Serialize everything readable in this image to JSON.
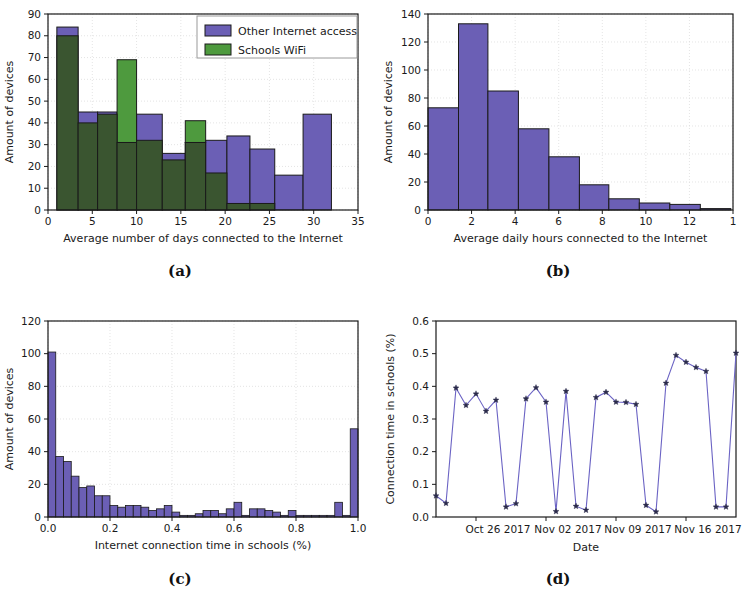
{
  "figure": {
    "caption_a": "(a)",
    "caption_b": "(b)",
    "caption_c": "(c)",
    "caption_d": "(d)"
  },
  "colors": {
    "purple": "#6b5fb5",
    "green": "#4e9a3e",
    "overlap": "#3a5530",
    "edge": "#1a1a1a",
    "line": "#6b63c4",
    "marker": "#2b2b4b",
    "axis": "#1a1a1a",
    "grid": "#d9d9d9",
    "background": "#ffffff"
  },
  "chart_data": [
    {
      "id": "panel_a",
      "type": "bar",
      "title": "",
      "xlabel": "Average number of days connected to the Internet",
      "ylabel": "Amount of devices",
      "xlim": [
        0,
        35
      ],
      "ylim": [
        0,
        90
      ],
      "xticks": [
        0,
        5,
        10,
        15,
        20,
        25,
        30,
        35
      ],
      "yticks": [
        0,
        10,
        20,
        30,
        40,
        50,
        60,
        70,
        80,
        90
      ],
      "grid": true,
      "legend_position": "upper right",
      "bin_width": 3.2,
      "bin_edges": [
        1.0,
        3.4,
        5.6,
        7.8,
        10.0,
        12.2,
        14.4,
        16.6,
        18.8,
        21.0,
        23.2,
        25.4,
        28.6,
        32.0
      ],
      "series": [
        {
          "name": "Other Internet access",
          "color": "#6b5fb5",
          "bins": [
            {
              "x0": 1.0,
              "x1": 3.4,
              "value": 84
            },
            {
              "x0": 3.4,
              "x1": 5.6,
              "value": 45
            },
            {
              "x0": 5.6,
              "x1": 7.8,
              "value": 45
            },
            {
              "x0": 7.8,
              "x1": 10.0,
              "value": 31
            },
            {
              "x0": 10.0,
              "x1": 12.9,
              "value": 44
            },
            {
              "x0": 12.9,
              "x1": 15.5,
              "value": 26
            },
            {
              "x0": 15.5,
              "x1": 17.8,
              "value": 31
            },
            {
              "x0": 17.8,
              "x1": 20.2,
              "value": 32
            },
            {
              "x0": 20.2,
              "x1": 22.8,
              "value": 34
            },
            {
              "x0": 22.8,
              "x1": 25.6,
              "value": 28
            },
            {
              "x0": 25.6,
              "x1": 28.8,
              "value": 16
            },
            {
              "x0": 28.8,
              "x1": 32.0,
              "value": 44
            }
          ]
        },
        {
          "name": "Schools WiFi",
          "color": "#4e9a3e",
          "bins": [
            {
              "x0": 1.0,
              "x1": 3.4,
              "value": 80
            },
            {
              "x0": 3.4,
              "x1": 5.6,
              "value": 40
            },
            {
              "x0": 5.6,
              "x1": 7.8,
              "value": 44
            },
            {
              "x0": 7.8,
              "x1": 10.0,
              "value": 69
            },
            {
              "x0": 10.0,
              "x1": 12.9,
              "value": 32
            },
            {
              "x0": 12.9,
              "x1": 15.5,
              "value": 23
            },
            {
              "x0": 15.5,
              "x1": 17.8,
              "value": 41
            },
            {
              "x0": 17.8,
              "x1": 20.2,
              "value": 17
            },
            {
              "x0": 20.2,
              "x1": 22.8,
              "value": 3
            },
            {
              "x0": 22.8,
              "x1": 25.6,
              "value": 3
            },
            {
              "x0": 25.6,
              "x1": 28.8,
              "value": 0
            },
            {
              "x0": 28.8,
              "x1": 32.0,
              "value": 0
            }
          ]
        }
      ]
    },
    {
      "id": "panel_b",
      "type": "bar",
      "title": "",
      "xlabel": "Average daily hours connected to the Internet",
      "ylabel": "Amount of devices",
      "xlim": [
        0,
        14
      ],
      "ylim": [
        0,
        140
      ],
      "xticks": [
        0,
        2,
        4,
        6,
        8,
        10,
        12,
        14
      ],
      "xtick_labels": [
        "0",
        "2",
        "4",
        "6",
        "8",
        "10",
        "12",
        "1"
      ],
      "yticks": [
        0,
        20,
        40,
        60,
        80,
        100,
        120,
        140
      ],
      "grid": true,
      "color": "#6b5fb5",
      "bins": [
        {
          "x0": 0.0,
          "x1": 1.4,
          "value": 73
        },
        {
          "x0": 1.4,
          "x1": 2.75,
          "value": 133
        },
        {
          "x0": 2.75,
          "x1": 4.15,
          "value": 85
        },
        {
          "x0": 4.15,
          "x1": 5.55,
          "value": 58
        },
        {
          "x0": 5.55,
          "x1": 6.95,
          "value": 38
        },
        {
          "x0": 6.95,
          "x1": 8.3,
          "value": 18
        },
        {
          "x0": 8.3,
          "x1": 9.7,
          "value": 8
        },
        {
          "x0": 9.7,
          "x1": 11.1,
          "value": 5
        },
        {
          "x0": 11.1,
          "x1": 12.5,
          "value": 4
        },
        {
          "x0": 12.5,
          "x1": 13.9,
          "value": 1
        }
      ]
    },
    {
      "id": "panel_c",
      "type": "bar",
      "title": "",
      "xlabel": "Internet connection time in schools (%)",
      "ylabel": "Amount of devices",
      "xlim": [
        0.0,
        1.0
      ],
      "ylim": [
        0,
        120
      ],
      "xticks": [
        0.0,
        0.2,
        0.4,
        0.6,
        0.8,
        1.0
      ],
      "xtick_labels": [
        "0.0",
        "0.2",
        "0.4",
        "0.6",
        "0.8",
        "1.0"
      ],
      "yticks": [
        0,
        20,
        40,
        60,
        80,
        100,
        120
      ],
      "grid": true,
      "color": "#6b5fb5",
      "bin_count": 40,
      "values": [
        101,
        37,
        34,
        25,
        18,
        19,
        13,
        13,
        7,
        6,
        7,
        7,
        6,
        4,
        5,
        7,
        3,
        1,
        1,
        2,
        4,
        4,
        2,
        5,
        9,
        1,
        5,
        5,
        4,
        3,
        1,
        4,
        1,
        1,
        1,
        1,
        1,
        9,
        1,
        54
      ]
    },
    {
      "id": "panel_d",
      "type": "line",
      "title": "",
      "xlabel": "Date",
      "ylabel": "Connection time in schools (%)",
      "ylim": [
        0.0,
        0.6
      ],
      "yticks": [
        0.0,
        0.1,
        0.2,
        0.3,
        0.4,
        0.5,
        0.6
      ],
      "ytick_labels": [
        "0.0",
        "0.1",
        "0.2",
        "0.3",
        "0.4",
        "0.5",
        "0.6"
      ],
      "xtick_labels": [
        "Oct 26 2017",
        "Nov 02 2017",
        "Nov 09 2017",
        "Nov 16 2017"
      ],
      "xtick_positions": [
        4,
        11,
        18,
        25
      ],
      "grid": false,
      "marker": "star",
      "line_color": "#6b63c4",
      "x": [
        0,
        1,
        2,
        3,
        4,
        5,
        6,
        7,
        8,
        9,
        10,
        11,
        12,
        13,
        14,
        15,
        16,
        17,
        18,
        19,
        20,
        21,
        22,
        23,
        24,
        25,
        26,
        27,
        28,
        29,
        30,
        31,
        32
      ],
      "values": [
        0.065,
        0.042,
        0.395,
        0.342,
        0.377,
        0.324,
        0.358,
        0.031,
        0.041,
        0.362,
        0.396,
        0.352,
        0.017,
        0.385,
        0.033,
        0.021,
        0.366,
        0.382,
        0.352,
        0.351,
        0.345,
        0.036,
        0.016,
        0.41,
        0.495,
        0.474,
        0.458,
        0.446,
        0.031,
        0.031,
        0.502
      ]
    }
  ]
}
